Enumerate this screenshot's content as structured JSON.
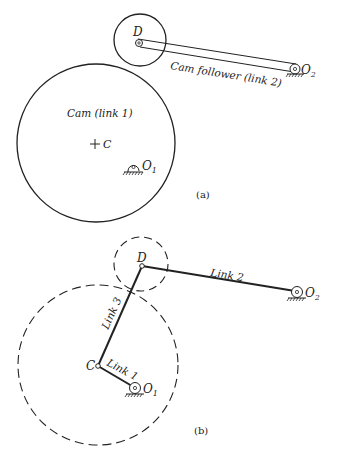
{
  "figure_a": {
    "caption": "(a)",
    "cam_label": "Cam (link 1)",
    "follower_label": "Cam follower (link 2)",
    "point_c": "C",
    "point_d": "D",
    "pivot_o1": "O",
    "pivot_o1_sub": "1",
    "pivot_o2": "O",
    "pivot_o2_sub": "2"
  },
  "figure_b": {
    "caption": "(b)",
    "link1_label": "Link 1",
    "link2_label": "Link 2",
    "link3_label": "Link 3",
    "point_c": "C",
    "point_d": "D",
    "pivot_o1": "O",
    "pivot_o1_sub": "1",
    "pivot_o2": "O",
    "pivot_o2_sub": "2"
  },
  "colors": {
    "ink": "#222222",
    "background": "#ffffff"
  }
}
